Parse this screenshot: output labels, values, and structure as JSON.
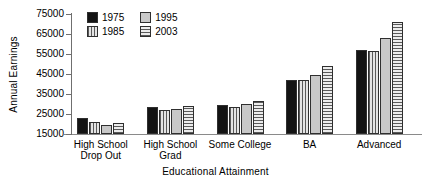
{
  "chart_data": {
    "type": "bar",
    "title": "",
    "xlabel": "Educational Attainment",
    "ylabel": "Annual Earnings",
    "categories": [
      "High School\nDrop Out",
      "High School\nGrad",
      "Some College",
      "BA",
      "Advanced"
    ],
    "series": [
      {
        "name": "1975",
        "values": [
          23000,
          28500,
          29500,
          42000,
          57000
        ],
        "pattern": "solid-black",
        "color": "#141414"
      },
      {
        "name": "1985",
        "values": [
          21000,
          27000,
          28500,
          42000,
          56500
        ],
        "pattern": "vertical-lines",
        "color": "#c9c9c9"
      },
      {
        "name": "1995",
        "values": [
          19500,
          27500,
          30000,
          44500,
          63000
        ],
        "pattern": "solid-gray",
        "color": "#c8c8c8"
      },
      {
        "name": "2003",
        "values": [
          20500,
          29000,
          31500,
          49000,
          71000
        ],
        "pattern": "horizontal-lines",
        "color": "#d6d6d6"
      }
    ],
    "ylim": [
      15000,
      75000
    ],
    "yticks": [
      15000,
      25000,
      35000,
      45000,
      55000,
      65000,
      75000
    ],
    "grid": false,
    "legend_position": "top-left-inside"
  },
  "legend": {
    "entries": [
      {
        "label": "1975"
      },
      {
        "label": "1995"
      },
      {
        "label": "1985"
      },
      {
        "label": "2003"
      }
    ]
  }
}
